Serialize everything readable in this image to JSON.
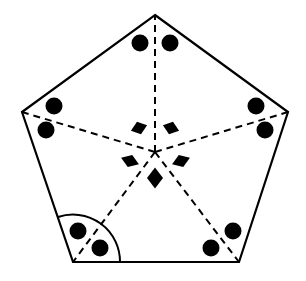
{
  "figure": {
    "shape_name": "pentagon",
    "background_color": "#ffffff",
    "stroke_color": "#000000",
    "marker_color": "#000000",
    "solid_stroke_width": 2.2,
    "dashed_stroke_width": 2.0,
    "dash_pattern": "7,5",
    "arc_stroke_width": 2.0
  },
  "pentagon": {
    "name": "pentagon-outline",
    "vertices": [
      {
        "label": "apex",
        "x": 155,
        "y": 15
      },
      {
        "label": "right-upper",
        "x": 288,
        "y": 112
      },
      {
        "label": "right-lower",
        "x": 239,
        "y": 262
      },
      {
        "label": "left-lower",
        "x": 73,
        "y": 262
      },
      {
        "label": "left-upper",
        "x": 22,
        "y": 112
      }
    ],
    "edges": [
      {
        "name": "edge-apex-to-right-upper",
        "from": 0,
        "to": 1
      },
      {
        "name": "edge-right-upper-to-right-lower",
        "from": 1,
        "to": 2
      },
      {
        "name": "edge-right-lower-to-left-lower",
        "from": 2,
        "to": 3
      },
      {
        "name": "edge-left-lower-to-left-upper",
        "from": 3,
        "to": 4
      },
      {
        "name": "edge-left-upper-to-apex",
        "from": 4,
        "to": 0
      }
    ]
  },
  "center": {
    "name": "pentagon-center",
    "x": 155,
    "y": 152
  },
  "dashed_segments": [
    {
      "name": "dashed-center-to-apex",
      "x1": 155,
      "y1": 152,
      "x2": 155,
      "y2": 15
    },
    {
      "name": "dashed-center-to-right-upper",
      "x1": 155,
      "y1": 152,
      "x2": 288,
      "y2": 112
    },
    {
      "name": "dashed-center-to-right-lower",
      "x1": 155,
      "y1": 152,
      "x2": 239,
      "y2": 262
    },
    {
      "name": "dashed-center-to-left-lower",
      "x1": 155,
      "y1": 152,
      "x2": 73,
      "y2": 262
    },
    {
      "name": "dashed-center-to-left-upper",
      "x1": 155,
      "y1": 152,
      "x2": 22,
      "y2": 112
    }
  ],
  "angle_arc": {
    "name": "angle-arc-left-lower-vertex",
    "vertex_x": 73,
    "vertex_y": 262,
    "radius": 47,
    "start_x": 58,
    "start_y": 217,
    "end_x": 120,
    "end_y": 262,
    "sweep_flag": 1,
    "large_arc_flag": 0
  },
  "circle_markers": {
    "name": "circle-markers",
    "radius": 8.5,
    "count": 10,
    "points": [
      {
        "name": "circle-marker-top-left",
        "x": 140,
        "y": 43
      },
      {
        "name": "circle-marker-top-right",
        "x": 170,
        "y": 43
      },
      {
        "name": "circle-marker-left-upper",
        "x": 54,
        "y": 106
      },
      {
        "name": "circle-marker-left-lower",
        "x": 46,
        "y": 130
      },
      {
        "name": "circle-marker-right-upper",
        "x": 256,
        "y": 106
      },
      {
        "name": "circle-marker-right-lower",
        "x": 265,
        "y": 130
      },
      {
        "name": "circle-marker-bottomleft-upper",
        "x": 78,
        "y": 231
      },
      {
        "name": "circle-marker-bottomleft-lower",
        "x": 100,
        "y": 248
      },
      {
        "name": "circle-marker-bottomright-lower",
        "x": 211,
        "y": 248
      },
      {
        "name": "circle-marker-bottomright-upper",
        "x": 233,
        "y": 231
      }
    ]
  },
  "diamond_markers": {
    "name": "diamond-markers",
    "count": 5,
    "points": [
      {
        "name": "diamond-marker-top-left",
        "x": 139,
        "y": 128,
        "rotation": -18,
        "width": 17,
        "height": 13
      },
      {
        "name": "diamond-marker-top-right",
        "x": 171,
        "y": 128,
        "rotation": 18,
        "width": 17,
        "height": 13
      },
      {
        "name": "diamond-marker-mid-left",
        "x": 130,
        "y": 161,
        "rotation": 20,
        "width": 19,
        "height": 13
      },
      {
        "name": "diamond-marker-mid-right",
        "x": 181,
        "y": 161,
        "rotation": -20,
        "width": 19,
        "height": 13
      },
      {
        "name": "diamond-marker-bottom",
        "x": 155,
        "y": 178,
        "rotation": 0,
        "width": 16,
        "height": 21
      }
    ]
  }
}
